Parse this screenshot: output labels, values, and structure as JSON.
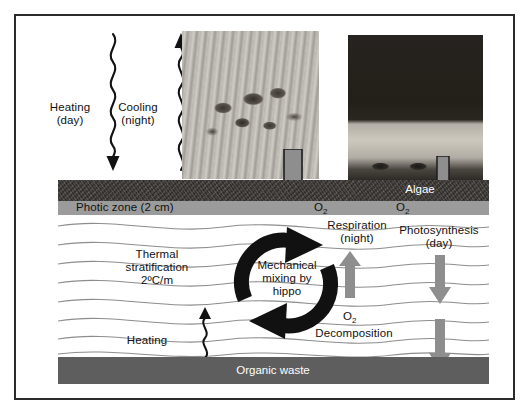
{
  "figure": {
    "frame_color": "#2b2b2b",
    "background": "#ffffff"
  },
  "colors": {
    "algae_band": "#3b3733",
    "photic_band": "#9b9b9b",
    "water": "#ffffff",
    "organic_waste_band": "#5e5e5e",
    "gray_arrow": "#8e8e8e",
    "black_arrow": "#111111",
    "wave_line": "#8d8d8d",
    "text": "#111111",
    "text_on_dark": "#ffffff"
  },
  "surface_flux": {
    "heating": {
      "label": "Heating\n(day)",
      "direction": "down",
      "arrow_style": "squiggle"
    },
    "cooling": {
      "label": "Cooling\n(night)",
      "direction": "up",
      "arrow_style": "squiggle"
    }
  },
  "photos": [
    {
      "name": "hippos-in-water",
      "caption": ""
    },
    {
      "name": "algae-on-shore",
      "caption": ""
    }
  ],
  "layers": {
    "algae": {
      "label": "Algae"
    },
    "photic": {
      "label": "Photic zone (2 cm)"
    },
    "waste": {
      "label": "Organic waste"
    }
  },
  "water_column": {
    "stratification": {
      "label": "Thermal\nstratification\n2ºC/m"
    },
    "heating_deep": {
      "label": "Heating",
      "arrow_style": "squiggle",
      "direction": "up"
    },
    "mixing": {
      "label": "Mechanical\nmixing by\nhippo",
      "arrow_style": "cycle"
    }
  },
  "oxygen": {
    "surface_left": "O₂",
    "surface_right": "O₂",
    "deep": "O₂"
  },
  "processes": [
    {
      "name": "respiration",
      "label": "Respiration\n(night)",
      "direction": "up",
      "arrow": "gray-block"
    },
    {
      "name": "photosynthesis",
      "label": "Photosynthesis\n(day)",
      "direction": "down",
      "arrow": "gray-block"
    },
    {
      "name": "decomposition",
      "label": "Decomposition",
      "direction": "down",
      "arrow": "gray-block"
    }
  ],
  "input_arrows": [
    {
      "name": "hippo-input",
      "direction": "down",
      "style": "outlined-gray-block"
    },
    {
      "name": "algae-input",
      "direction": "down",
      "style": "outlined-gray-block"
    }
  ]
}
